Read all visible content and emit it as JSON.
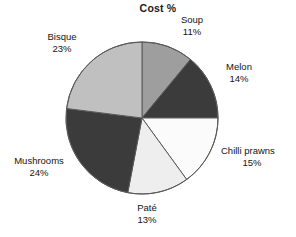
{
  "chart_data": {
    "type": "pie",
    "title": "Cost %",
    "xlabel": "",
    "ylabel": "",
    "legend": "none",
    "grid": false,
    "start_angle_deg": 0,
    "direction": "clockwise",
    "value_unit": "%",
    "categories": [
      "Soup",
      "Melon",
      "Chilli prawns",
      "Paté",
      "Mushrooms",
      "Bisque"
    ],
    "values": [
      11,
      14,
      15,
      13,
      24,
      23
    ],
    "slices": [
      {
        "label": "Soup",
        "value": 11,
        "value_text": "11%",
        "color": "#9e9e9e"
      },
      {
        "label": "Melon",
        "value": 14,
        "value_text": "14%",
        "color": "#3b3b3b"
      },
      {
        "label": "Chilli prawns",
        "value": 15,
        "value_text": "15%",
        "color": "#fbfbfb"
      },
      {
        "label": "Paté",
        "value": 13,
        "value_text": "13%",
        "color": "#eeeeee"
      },
      {
        "label": "Mushrooms",
        "value": 24,
        "value_text": "24%",
        "color": "#3b3b3b"
      },
      {
        "label": "Bisque",
        "value": 23,
        "value_text": "23%",
        "color": "#c0c0c0"
      }
    ],
    "colors": {
      "outline": "#5a5a5a",
      "text": "#141414",
      "title": "#1a1a1a",
      "background": "#ffffff"
    }
  },
  "labels": {
    "soup": {
      "name": "Soup",
      "value": "11%"
    },
    "melon": {
      "name": "Melon",
      "value": "14%"
    },
    "chilli": {
      "name": "Chilli prawns",
      "value": "15%"
    },
    "pate": {
      "name": "Paté",
      "value": "13%"
    },
    "mushrooms": {
      "name": "Mushrooms",
      "value": "24%"
    },
    "bisque": {
      "name": "Bisque",
      "value": "23%"
    }
  }
}
